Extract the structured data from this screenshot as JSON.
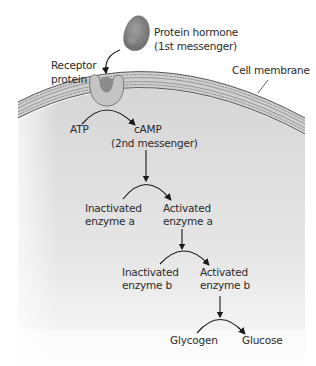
{
  "diagram": {
    "type": "signal-transduction-cascade",
    "colors": {
      "background": "#ffffff",
      "cytoplasm_top": "#d9d9d9",
      "cytoplasm_bottom": "#f7f7f7",
      "membrane": "#c9c9c9",
      "membrane_lines": "#5a5a5a",
      "hormone": "#8a8a8a",
      "receptor": "#b8b8b8",
      "arrow": "#1a1a1a",
      "text": "#2a2a2a"
    },
    "labels": {
      "hormone_line1": "Protein hormone",
      "hormone_line2": "(1st messenger)",
      "receptor_line1": "Receptor",
      "receptor_line2": "protein",
      "cell_membrane": "Cell membrane",
      "atp": "ATP",
      "camp": "cAMP",
      "second_messenger": "(2nd messenger)",
      "inactivated_a_line1": "Inactivated",
      "inactivated_a_line2": "enzyme a",
      "activated_a_line1": "Activated",
      "activated_a_line2": "enzyme a",
      "inactivated_b_line1": "Inactivated",
      "inactivated_b_line2": "enzyme b",
      "activated_b_line1": "Activated",
      "activated_b_line2": "enzyme b",
      "glycogen": "Glycogen",
      "glucose": "Glucose"
    },
    "steps": [
      {
        "from": "Protein hormone",
        "to": "Receptor protein"
      },
      {
        "from": "ATP",
        "to": "cAMP"
      },
      {
        "from": "cAMP",
        "to": "Inactivated enzyme a → Activated enzyme a"
      },
      {
        "from": "Activated enzyme a",
        "to": "Inactivated enzyme b → Activated enzyme b"
      },
      {
        "from": "Activated enzyme b",
        "to": "Glycogen → Glucose"
      }
    ]
  }
}
